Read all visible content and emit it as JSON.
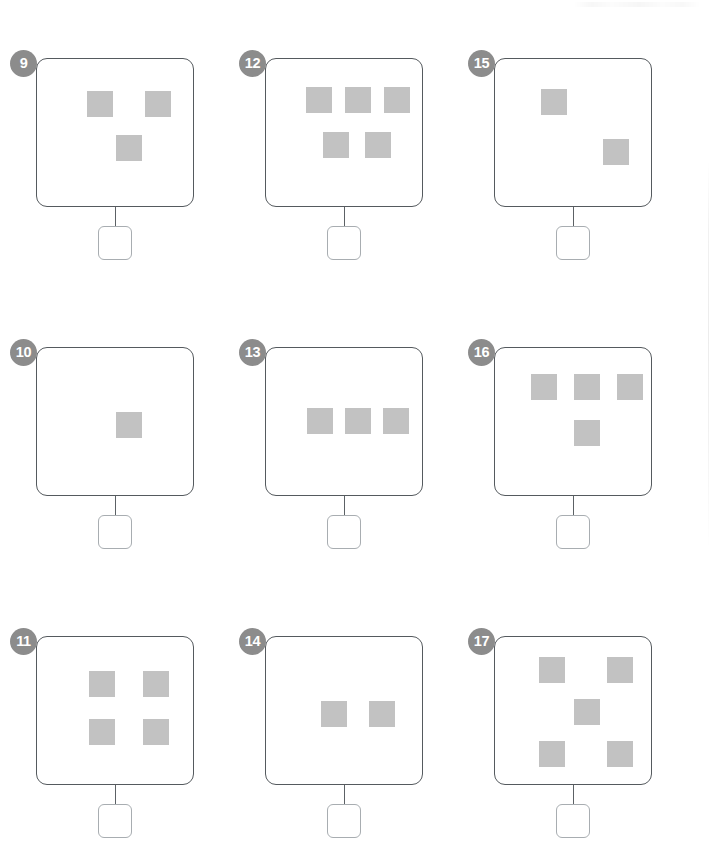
{
  "worksheet": {
    "type": "counting-worksheet",
    "description": "Count the grey squares in each box and write the number in the answer box below.",
    "columns": 3,
    "rows": 3,
    "colors": {
      "badge_background": "#8c8c8c",
      "badge_text": "#ffffff",
      "frame_border": "#555a5e",
      "square_fill": "#c2c2c2",
      "answer_box_border": "#a8adb1",
      "connector": "#5c6165",
      "page_background": "#ffffff"
    },
    "answer_value": "",
    "problems": [
      {
        "number": "9",
        "count": 3,
        "col": 0,
        "row": 0,
        "squares": [
          {
            "x": 50,
            "y": 32
          },
          {
            "x": 108,
            "y": 32
          },
          {
            "x": 79,
            "y": 76
          }
        ]
      },
      {
        "number": "10",
        "count": 1,
        "col": 0,
        "row": 1,
        "squares": [
          {
            "x": 79,
            "y": 64
          }
        ]
      },
      {
        "number": "11",
        "count": 4,
        "col": 0,
        "row": 2,
        "squares": [
          {
            "x": 52,
            "y": 34
          },
          {
            "x": 106,
            "y": 34
          },
          {
            "x": 52,
            "y": 82
          },
          {
            "x": 106,
            "y": 82
          }
        ]
      },
      {
        "number": "12",
        "count": 5,
        "col": 1,
        "row": 0,
        "squares": [
          {
            "x": 40,
            "y": 28
          },
          {
            "x": 79,
            "y": 28
          },
          {
            "x": 118,
            "y": 28
          },
          {
            "x": 57,
            "y": 73
          },
          {
            "x": 99,
            "y": 73
          }
        ]
      },
      {
        "number": "13",
        "count": 3,
        "col": 1,
        "row": 1,
        "squares": [
          {
            "x": 41,
            "y": 60
          },
          {
            "x": 79,
            "y": 60
          },
          {
            "x": 117,
            "y": 60
          }
        ]
      },
      {
        "number": "14",
        "count": 2,
        "col": 1,
        "row": 2,
        "squares": [
          {
            "x": 55,
            "y": 64
          },
          {
            "x": 103,
            "y": 64
          }
        ]
      },
      {
        "number": "15",
        "count": 2,
        "col": 2,
        "row": 0,
        "squares": [
          {
            "x": 46,
            "y": 30
          },
          {
            "x": 108,
            "y": 80
          }
        ]
      },
      {
        "number": "16",
        "count": 4,
        "col": 2,
        "row": 1,
        "squares": [
          {
            "x": 36,
            "y": 26
          },
          {
            "x": 79,
            "y": 26
          },
          {
            "x": 122,
            "y": 26
          },
          {
            "x": 79,
            "y": 72
          }
        ]
      },
      {
        "number": "17",
        "count": 5,
        "col": 2,
        "row": 2,
        "squares": [
          {
            "x": 44,
            "y": 20
          },
          {
            "x": 112,
            "y": 20
          },
          {
            "x": 79,
            "y": 62
          },
          {
            "x": 44,
            "y": 104
          },
          {
            "x": 112,
            "y": 104
          }
        ]
      }
    ]
  }
}
